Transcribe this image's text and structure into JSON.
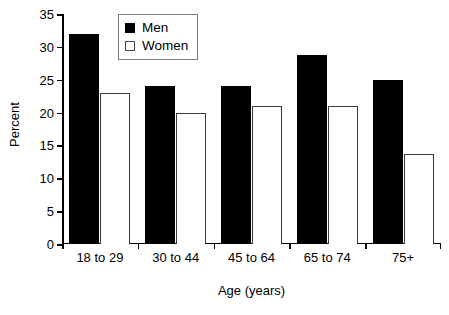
{
  "chart_data": {
    "type": "bar",
    "title": "",
    "subtitle": "",
    "xlabel": "Age (years)",
    "ylabel": "Percent",
    "categories": [
      "18 to 29",
      "30 to 44",
      "45 to 64",
      "65 to 74",
      "75+"
    ],
    "series": [
      {
        "name": "Men",
        "color": "#000000",
        "values": [
          32,
          24,
          24,
          28.8,
          25
        ]
      },
      {
        "name": "Women",
        "color": "#ffffff",
        "values": [
          23,
          20,
          21,
          21,
          13.7
        ]
      }
    ],
    "ylim": [
      0,
      35
    ],
    "ytick_values": [
      0,
      5,
      10,
      15,
      20,
      25,
      30,
      35
    ],
    "ytick_labels": [
      "0",
      "5",
      "10",
      "15",
      "20",
      "25",
      "30",
      "35"
    ],
    "grid": false,
    "legend_position": "top-left-inside",
    "legend_entries": [
      "Men",
      "Women"
    ],
    "annotations": []
  }
}
